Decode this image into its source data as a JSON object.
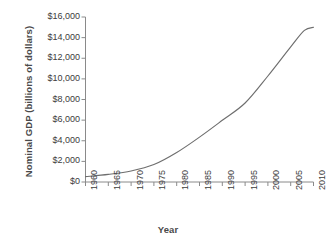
{
  "chart_data": {
    "type": "line",
    "title": "",
    "xlabel": "Year",
    "ylabel": "Nominal GDP (billions of dollars)",
    "xlim": [
      1960,
      2010
    ],
    "ylim": [
      0,
      16000
    ],
    "grid": false,
    "legend": null,
    "line_color": "#6e6e6e",
    "xticks": [
      1960,
      1965,
      1970,
      1975,
      1980,
      1985,
      1990,
      1995,
      2000,
      2005,
      2010
    ],
    "xtick_labels": [
      "1960",
      "1965",
      "1970",
      "1975",
      "1980",
      "1985",
      "1990",
      "1995",
      "2000",
      "2005",
      "2010"
    ],
    "yticks": [
      0,
      2000,
      4000,
      6000,
      8000,
      10000,
      12000,
      14000,
      16000
    ],
    "ytick_labels": [
      "$0",
      "$2,000",
      "$4,000",
      "$6,000",
      "$8,000",
      "$10,000",
      "$12,000",
      "$14,000",
      "$16,000"
    ],
    "x": [
      1960,
      1965,
      1970,
      1975,
      1980,
      1985,
      1990,
      1995,
      2000,
      2005,
      2008,
      2010
    ],
    "values": [
      520,
      740,
      1070,
      1690,
      2860,
      4350,
      5980,
      7660,
      10280,
      13100,
      14700,
      15000
    ],
    "series": [
      {
        "name": "Nominal GDP",
        "values": [
          520,
          740,
          1070,
          1690,
          2860,
          4350,
          5980,
          7660,
          10280,
          13100,
          14700,
          15000
        ]
      }
    ]
  }
}
